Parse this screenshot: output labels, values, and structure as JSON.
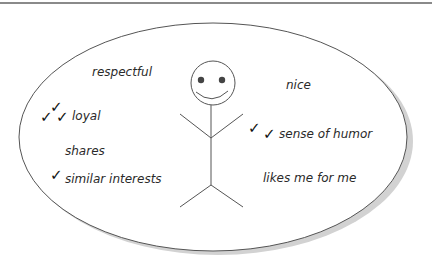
{
  "diagram": {
    "type": "qualities-bubble",
    "colors": {
      "ink": "#2a2a2a",
      "outline": "#555555",
      "shadow": "#cfcfcf",
      "rule": "#8a8a8a",
      "background": "#ffffff"
    },
    "figure": {
      "label": "stick-figure-smiling"
    },
    "qualities": [
      {
        "id": "respectful",
        "text": "respectful",
        "checks": 0,
        "check_glyphs": ""
      },
      {
        "id": "nice",
        "text": "nice",
        "checks": 0,
        "check_glyphs": ""
      },
      {
        "id": "loyal",
        "text": "loyal",
        "checks": 2,
        "check_glyphs": "✓✓"
      },
      {
        "id": "sense-of-humor",
        "text": "sense of humor",
        "checks": 2,
        "check_glyphs": "✓ ✓"
      },
      {
        "id": "shares",
        "text": "shares",
        "checks": 0,
        "check_glyphs": ""
      },
      {
        "id": "similar-interests",
        "text": "similar interests",
        "checks": 1,
        "check_glyphs": "✓"
      },
      {
        "id": "likes-me-for-me",
        "text": "likes me for me",
        "checks": 0,
        "check_glyphs": ""
      }
    ]
  }
}
